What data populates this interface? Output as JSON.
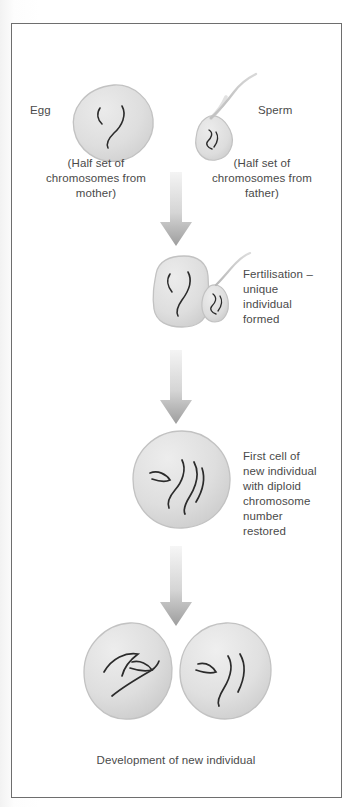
{
  "figure": {
    "border_color": "#6e6e6e",
    "background": "#ffffff"
  },
  "palette": {
    "cell_fill": "#dcdcdc",
    "cell_fill_light": "#e8e8e8",
    "cell_stroke": "#bdbdbd",
    "chromosome": "#2b2b2b",
    "arrow_top": "#f0f0f0",
    "arrow_bottom": "#9a9a9a",
    "text": "#4a4a4a"
  },
  "stages": [
    {
      "id": "gametes",
      "egg": {
        "label": "Egg",
        "caption": "(Half set of\nchromosomes from\nmother)",
        "chromosome_count": 2,
        "shape": "irregular-round-blob"
      },
      "sperm": {
        "label": "Sperm",
        "caption": "(Half set of\nchromosomes from\nfather)",
        "chromosome_count": 1,
        "shape": "teardrop-head-with-wavy-tail"
      }
    },
    {
      "id": "fertilisation",
      "text": "Fertilisation –\nunique\nindividual\nformed",
      "egg_chromosome_count": 2,
      "sperm_chromosome_count": 1
    },
    {
      "id": "first-cell",
      "text": "First cell of\nnew individual\nwith diploid\nchromosome\nnumber\nrestored",
      "chromosome_count": 4,
      "shape": "round-cell"
    },
    {
      "id": "development",
      "caption": "Development of new individual",
      "cell_count": 2,
      "chromosomes_per_cell": 3
    }
  ],
  "arrows": [
    {
      "id": "arrow-1",
      "direction": "down",
      "between": "gametes-to-fertilisation"
    },
    {
      "id": "arrow-2",
      "direction": "down",
      "between": "fertilisation-to-first-cell"
    },
    {
      "id": "arrow-3",
      "direction": "down",
      "between": "first-cell-to-development"
    }
  ]
}
